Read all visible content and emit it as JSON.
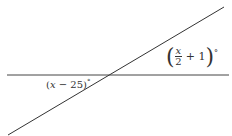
{
  "diagram": {
    "type": "intersecting-lines",
    "lines": [
      {
        "name": "horizontal-line",
        "x1": 7,
        "y1": 75,
        "x2": 229,
        "y2": 75
      },
      {
        "name": "transversal-line",
        "x1": 8,
        "y1": 135,
        "x2": 224,
        "y2": 7
      }
    ],
    "angle_right": {
      "var": "x",
      "den": "2",
      "plus": "+ 1",
      "deg": "°"
    },
    "angle_left": {
      "open": "(",
      "var": "x",
      "rest": " − 25)",
      "deg": "°"
    },
    "stroke_color": "#333333"
  }
}
